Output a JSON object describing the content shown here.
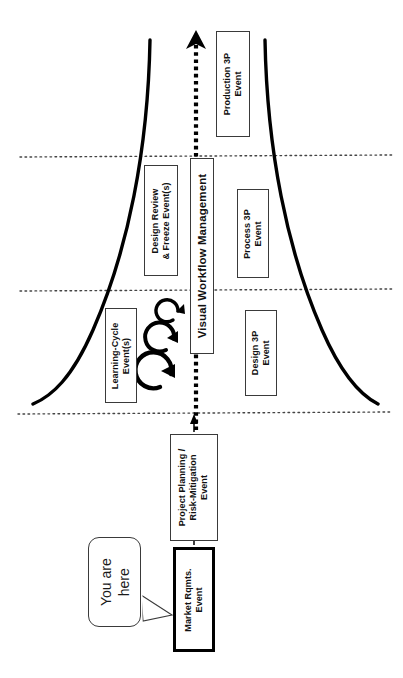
{
  "diagram": {
    "title": "Visual Workflow Management",
    "orientation": "rotated-90",
    "axis": {
      "name": "Visual Workflow Management",
      "arrow_direction": "up",
      "line_style": "dotted"
    },
    "flow_boxes": [
      {
        "id": "market-rqmts-event",
        "label": "Market Rqmts.\nEvent",
        "line1": "Market Rqmts.",
        "line2": "Event",
        "emphasis": "bold-border"
      },
      {
        "id": "project-planning-event",
        "label": "Project Planning /\nRisk-Mitigation\nEvent",
        "line1": "Project Planning /",
        "line2": "Risk-Mitigation",
        "line3": "Event",
        "emphasis": "normal"
      }
    ],
    "left_boxes": [
      {
        "id": "design-review-freeze",
        "line1": "Design Review",
        "line2": "& Freeze Event(s)"
      },
      {
        "id": "learning-cycle",
        "line1": "Learning-Cycle",
        "line2": "Event(s)"
      }
    ],
    "right_boxes": [
      {
        "id": "production-3p",
        "line1": "Production 3P",
        "line2": "Event"
      },
      {
        "id": "process-3p",
        "line1": "Process 3P",
        "line2": "Event"
      },
      {
        "id": "design-3p",
        "line1": "Design 3P",
        "line2": "Event"
      }
    ],
    "center_box": {
      "id": "visual-workflow-management",
      "label": "Visual Workflow Management"
    },
    "callout": {
      "id": "you-are-here",
      "line1": "You are",
      "line2": "here",
      "points_to": "market-rqmts-event"
    },
    "loop_arrows": {
      "count": 3,
      "meaning": "learning cycles",
      "sizes": [
        "small",
        "medium",
        "large"
      ]
    },
    "phase_dividers": {
      "count": 3,
      "style": "dotted"
    },
    "funnel": {
      "description": "two mirrored flared curves forming a trumpet / funnel",
      "stroke": "#000000"
    },
    "colors": {
      "ink": "#000000",
      "box_border": "#3a3a3a",
      "background": "#ffffff"
    }
  }
}
